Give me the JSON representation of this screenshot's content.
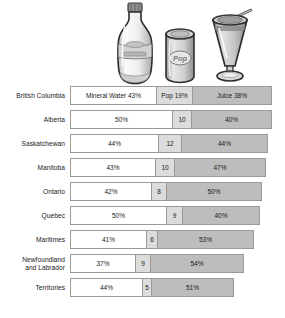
{
  "chart_data": {
    "type": "bar",
    "subtype": "stacked-horizontal-100pct",
    "title": "",
    "xlabel": "",
    "ylabel": "",
    "legend_position": "top-icons",
    "grid": false,
    "categories": [
      "British Columbia",
      "Alberta",
      "Saskatchewan",
      "Manitoba",
      "Ontario",
      "Quebec",
      "Maritimes",
      "Newfoundland and Labrador",
      "Territories"
    ],
    "series": [
      {
        "name": "Mineral Water",
        "values": [
          43,
          50,
          44,
          43,
          42,
          50,
          41,
          37,
          44
        ]
      },
      {
        "name": "Pop",
        "values": [
          19,
          10,
          12,
          10,
          8,
          9,
          6,
          9,
          5
        ]
      },
      {
        "name": "Juice",
        "values": [
          38,
          40,
          44,
          47,
          50,
          40,
          53,
          54,
          51
        ]
      }
    ],
    "colors": {
      "mineral_water": "#ffffff",
      "pop": "#dcdcdc",
      "juice": "#bdbdbd",
      "outline": "#9a9a9a"
    }
  },
  "icons": [
    {
      "name": "mineral-water-bottle-icon",
      "label": "Mineral Water"
    },
    {
      "name": "pop-can-icon",
      "label": "Pop"
    },
    {
      "name": "juice-glass-icon",
      "label": "Juice"
    }
  ],
  "rows": [
    {
      "label_line1": "British Columbia",
      "label_line2": "",
      "bar_width": 202,
      "segments": [
        {
          "text": "Mineral Water 43%",
          "width": 85
        },
        {
          "text": "Pop 19%",
          "width": 37
        },
        {
          "text": "Juice 38%",
          "width": 78
        }
      ]
    },
    {
      "label_line1": "Alberta",
      "label_line2": "",
      "bar_width": 202,
      "segments": [
        {
          "text": "50%",
          "width": 101
        },
        {
          "text": "10",
          "width": 20
        },
        {
          "text": "40%",
          "width": 79
        }
      ]
    },
    {
      "label_line1": "Saskatchewan",
      "label_line2": "",
      "bar_width": 198,
      "segments": [
        {
          "text": "44%",
          "width": 87
        },
        {
          "text": "12",
          "width": 24
        },
        {
          "text": "44%",
          "width": 85
        }
      ]
    },
    {
      "label_line1": "Manitoba",
      "label_line2": "",
      "bar_width": 196,
      "segments": [
        {
          "text": "43%",
          "width": 84
        },
        {
          "text": "10",
          "width": 20
        },
        {
          "text": "47%",
          "width": 90
        }
      ]
    },
    {
      "label_line1": "Ontario",
      "label_line2": "",
      "bar_width": 192,
      "segments": [
        {
          "text": "42%",
          "width": 80
        },
        {
          "text": "8",
          "width": 16
        },
        {
          "text": "50%",
          "width": 94
        }
      ]
    },
    {
      "label_line1": "Quebec",
      "label_line2": "",
      "bar_width": 190,
      "segments": [
        {
          "text": "50%",
          "width": 95
        },
        {
          "text": "9",
          "width": 17
        },
        {
          "text": "40%",
          "width": 76
        }
      ]
    },
    {
      "label_line1": "Maritimes",
      "label_line2": "",
      "bar_width": 184,
      "segments": [
        {
          "text": "41%",
          "width": 75
        },
        {
          "text": "6",
          "width": 12
        },
        {
          "text": "53%",
          "width": 95
        }
      ]
    },
    {
      "label_line1": "Newfoundland",
      "label_line2": "and Labrador",
      "bar_width": 174,
      "segments": [
        {
          "text": "37%",
          "width": 64
        },
        {
          "text": "9",
          "width": 16
        },
        {
          "text": "54%",
          "width": 92
        }
      ]
    },
    {
      "label_line1": "Territories",
      "label_line2": "",
      "bar_width": 164,
      "segments": [
        {
          "text": "44%",
          "width": 71
        },
        {
          "text": "5",
          "width": 10
        },
        {
          "text": "51%",
          "width": 81
        }
      ]
    }
  ]
}
